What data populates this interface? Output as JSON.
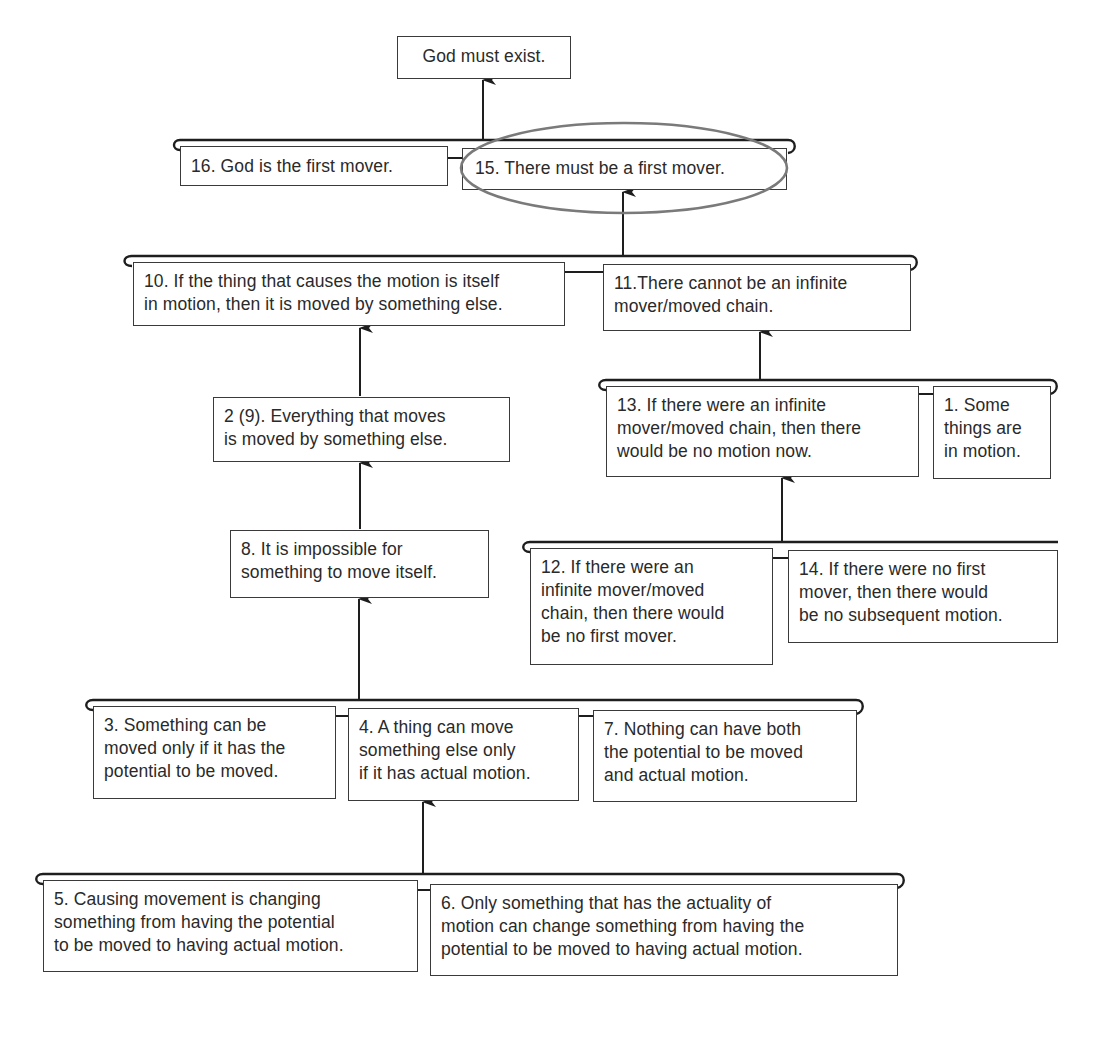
{
  "diagram": {
    "conclusion": {
      "id": "conclusion",
      "text": "God must exist."
    },
    "nodes": [
      {
        "id": "16",
        "text": "16. God is the first mover."
      },
      {
        "id": "15",
        "text": "15. There must be a first mover.",
        "highlighted": true
      },
      {
        "id": "10",
        "text": "10. If the thing that causes the motion is itself\nin motion, then it is moved by something else."
      },
      {
        "id": "11",
        "text": "11.There cannot be an infinite\nmover/moved chain."
      },
      {
        "id": "2_9",
        "text": "2 (9). Everything that moves\nis moved by something else."
      },
      {
        "id": "13",
        "text": "13. If there were an infinite\nmover/moved chain, then there\nwould be no motion now."
      },
      {
        "id": "1",
        "text": "1. Some\nthings are\nin motion."
      },
      {
        "id": "8",
        "text": "8. It is impossible for\nsomething to move itself."
      },
      {
        "id": "12",
        "text": "12. If there were an\ninfinite mover/moved\nchain, then there would\nbe no first mover."
      },
      {
        "id": "14",
        "text": "14. If there were no first\nmover, then there would\nbe no subsequent motion."
      },
      {
        "id": "3",
        "text": "3. Something can be\nmoved only if it has the\npotential to be moved."
      },
      {
        "id": "4",
        "text": "4. A thing can move\nsomething else only\nif it has actual motion."
      },
      {
        "id": "7",
        "text": "7. Nothing can have both\nthe potential to be moved\nand actual motion."
      },
      {
        "id": "5",
        "text": "5. Causing movement is changing\nsomething from having the potential\nto be moved to having actual motion."
      },
      {
        "id": "6",
        "text": "6. Only something that has the actuality of\nmotion can change something from having the\npotential to be moved to having actual motion."
      }
    ],
    "premise_groups": [
      {
        "premises": [
          "16",
          "15"
        ],
        "supports": "conclusion"
      },
      {
        "premises": [
          "10",
          "11"
        ],
        "supports": "15"
      },
      {
        "premises": [
          "2_9"
        ],
        "supports": "10"
      },
      {
        "premises": [
          "13",
          "1"
        ],
        "supports": "11"
      },
      {
        "premises": [
          "8"
        ],
        "supports": "2_9"
      },
      {
        "premises": [
          "12",
          "14"
        ],
        "supports": "13"
      },
      {
        "premises": [
          "3",
          "4",
          "7"
        ],
        "supports": "8"
      },
      {
        "premises": [
          "5",
          "6"
        ],
        "supports": "4"
      }
    ],
    "colors": {
      "line": "#1e1e1e",
      "box_border": "#3a3a3a",
      "highlight_ellipse": "#7a7a7a",
      "background": "#ffffff"
    }
  }
}
